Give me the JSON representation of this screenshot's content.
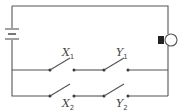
{
  "diagram": {
    "type": "circuit",
    "components": {
      "battery": {
        "label": ""
      },
      "bulb": {
        "label": ""
      },
      "switches": [
        {
          "id": "X1",
          "letter": "X",
          "subscript": "1",
          "branch": "top"
        },
        {
          "id": "Y1",
          "letter": "Y",
          "subscript": "1",
          "branch": "top"
        },
        {
          "id": "X2",
          "letter": "X",
          "subscript": "2",
          "branch": "bottom"
        },
        {
          "id": "Y2",
          "letter": "Y",
          "subscript": "2",
          "branch": "bottom"
        }
      ]
    },
    "colors": {
      "wire": "#555555",
      "bulb_base": "#222222"
    }
  }
}
